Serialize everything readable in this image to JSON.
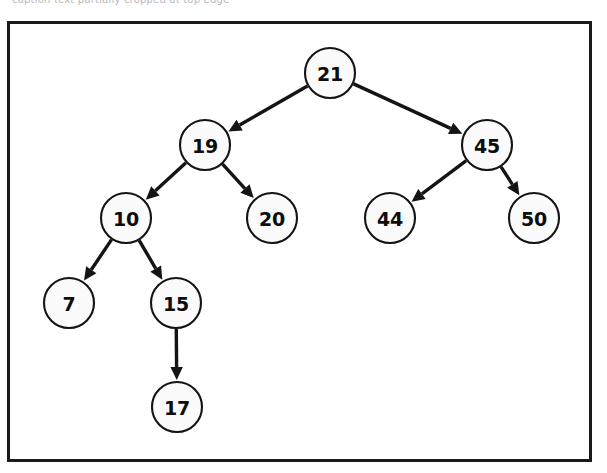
{
  "figure": {
    "kind": "binary-search-tree-diagram",
    "frame": {
      "border_color": "#1a1a1a",
      "background_color": "#ffffff",
      "x": 7,
      "y": 21,
      "width": 585,
      "height": 441
    },
    "scan_artifact_text": "caption text partially cropped at top edge"
  },
  "style": {
    "node_fill": "#fbfbfb",
    "node_stroke": "#141414",
    "label_color": "#0d0d0d",
    "edge_color": "#141414",
    "node_radius": 25
  },
  "chart_data": {
    "type": "diagram",
    "title": "",
    "structure": "binary search tree",
    "root": "21",
    "nodes": [
      {
        "id": "n21",
        "label": "21",
        "cx": 330,
        "cy": 73,
        "r": 25,
        "depth": 0
      },
      {
        "id": "n19",
        "label": "19",
        "cx": 205,
        "cy": 145,
        "r": 25,
        "depth": 1
      },
      {
        "id": "n45",
        "label": "45",
        "cx": 487,
        "cy": 145,
        "r": 25,
        "depth": 1
      },
      {
        "id": "n10",
        "label": "10",
        "cx": 126,
        "cy": 218,
        "r": 25,
        "depth": 2
      },
      {
        "id": "n20",
        "label": "20",
        "cx": 272,
        "cy": 218,
        "r": 25,
        "depth": 2
      },
      {
        "id": "n44",
        "label": "44",
        "cx": 390,
        "cy": 218,
        "r": 25,
        "depth": 2
      },
      {
        "id": "n50",
        "label": "50",
        "cx": 534,
        "cy": 218,
        "r": 25,
        "depth": 2
      },
      {
        "id": "n7",
        "label": "7",
        "cx": 69,
        "cy": 303,
        "r": 25,
        "depth": 3
      },
      {
        "id": "n15",
        "label": "15",
        "cx": 176,
        "cy": 303,
        "r": 25,
        "depth": 3
      },
      {
        "id": "n17",
        "label": "17",
        "cx": 177,
        "cy": 407,
        "r": 25,
        "depth": 4
      }
    ],
    "edges": [
      {
        "from": "n21",
        "to": "n19",
        "side": "left",
        "directed": true
      },
      {
        "from": "n21",
        "to": "n45",
        "side": "right",
        "directed": true
      },
      {
        "from": "n19",
        "to": "n10",
        "side": "left",
        "directed": true
      },
      {
        "from": "n19",
        "to": "n20",
        "side": "right",
        "directed": true
      },
      {
        "from": "n10",
        "to": "n7",
        "side": "left",
        "directed": true
      },
      {
        "from": "n10",
        "to": "n15",
        "side": "right",
        "directed": true
      },
      {
        "from": "n15",
        "to": "n17",
        "side": "right",
        "directed": true
      },
      {
        "from": "n45",
        "to": "n44",
        "side": "left",
        "directed": true
      },
      {
        "from": "n45",
        "to": "n50",
        "side": "right",
        "directed": true
      }
    ]
  }
}
